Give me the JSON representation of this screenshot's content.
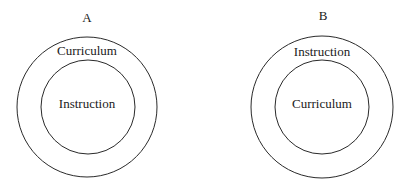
{
  "diagrams": [
    {
      "label": "A",
      "outer_text": "Curriculum",
      "inner_text": "Instruction",
      "center": [
        87,
        107
      ],
      "outer_radius": 70,
      "inner_radius": 47
    },
    {
      "label": "B",
      "outer_text": "Instruction",
      "inner_text": "Curriculum",
      "center": [
        322,
        107
      ],
      "outer_radius": 71,
      "inner_radius": 47
    }
  ],
  "colors": {
    "stroke": "#2a2a2a",
    "text": "#1a1a1a",
    "background": "#ffffff"
  }
}
